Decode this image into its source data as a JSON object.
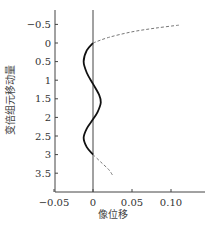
{
  "chart_data": {
    "type": "line",
    "title": "",
    "xlabel": "像位移",
    "ylabel": "变倍组元移动量",
    "xlim": [
      -0.05,
      0.13
    ],
    "ylim": [
      -0.8,
      4.0
    ],
    "y_inverted": true,
    "grid": false,
    "legend": "none",
    "x_ticks": [
      -0.05,
      0,
      0.05,
      0.1
    ],
    "x_tick_labels": [
      "−0.05",
      "0",
      "0.05",
      "0.10"
    ],
    "y_ticks": [
      -0.5,
      0,
      0.5,
      1,
      1.5,
      2,
      2.5,
      3,
      3.5
    ],
    "y_tick_labels": [
      "−0.5",
      "0",
      "0.5",
      "1",
      "1.5",
      "2",
      "2.5",
      "3",
      "3.5"
    ],
    "series": [
      {
        "name": "compensated image shift",
        "style": "solid",
        "color": "#111111",
        "points": [
          [
            0,
            0
          ],
          [
            -0.008,
            0.2
          ],
          [
            -0.012,
            0.5
          ],
          [
            -0.008,
            0.8
          ],
          [
            0,
            1.1
          ],
          [
            0.008,
            1.4
          ],
          [
            0.01,
            1.6
          ],
          [
            0.006,
            1.85
          ],
          [
            0,
            2.05
          ],
          [
            -0.008,
            2.3
          ],
          [
            -0.012,
            2.55
          ],
          [
            -0.008,
            2.8
          ],
          [
            0,
            3.0
          ]
        ]
      },
      {
        "name": "extrapolated (above range)",
        "style": "dashed",
        "color": "#777777",
        "points": [
          [
            0,
            0
          ],
          [
            0.02,
            -0.15
          ],
          [
            0.05,
            -0.3
          ],
          [
            0.08,
            -0.4
          ],
          [
            0.11,
            -0.48
          ]
        ]
      },
      {
        "name": "extrapolated (below range)",
        "style": "dashed",
        "color": "#777777",
        "points": [
          [
            0,
            3.0
          ],
          [
            0.01,
            3.2
          ],
          [
            0.02,
            3.4
          ],
          [
            0.025,
            3.55
          ]
        ]
      }
    ]
  },
  "axes": {
    "x_title": "像位移",
    "y_title": "变倍组元移动量"
  }
}
